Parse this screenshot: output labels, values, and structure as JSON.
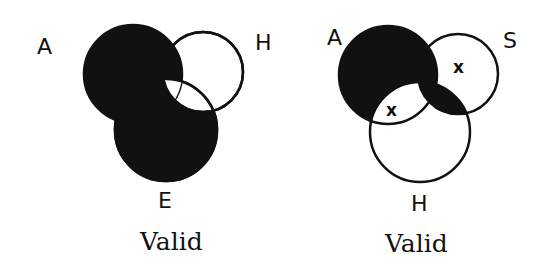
{
  "diagrams": [
    {
      "caption": "Valid",
      "circles": [
        {
          "label": "A",
          "cx": 133,
          "cy": 74,
          "r": 49
        },
        {
          "label": "H",
          "cx": 203,
          "cy": 72,
          "r": 40
        },
        {
          "label": "E",
          "cx": 166,
          "cy": 130,
          "r": 51
        }
      ],
      "labels": [
        {
          "text": "A",
          "x": 37,
          "y": 54
        },
        {
          "text": "H",
          "x": 255,
          "y": 50
        },
        {
          "text": "E",
          "x": 158,
          "y": 208
        }
      ],
      "marks": [
        {
          "text": "x",
          "x": 160,
          "y": 101
        }
      ],
      "shaded_regions": [
        "A only",
        "A∩E not H",
        "E only",
        "A∩H not E"
      ],
      "unshaded_regions": [
        "A∩H∩E (x)",
        "H only",
        "H∩E not A"
      ]
    },
    {
      "caption": "Valid",
      "circles": [
        {
          "label": "A",
          "cx": 388,
          "cy": 75,
          "r": 49
        },
        {
          "label": "S",
          "cx": 458,
          "cy": 74,
          "r": 40
        },
        {
          "label": "H",
          "cx": 420,
          "cy": 132,
          "r": 50
        }
      ],
      "labels": [
        {
          "text": "A",
          "x": 327,
          "y": 45
        },
        {
          "text": "S",
          "x": 503,
          "y": 48
        },
        {
          "text": "H",
          "x": 411,
          "y": 211
        }
      ],
      "marks": [
        {
          "text": "x",
          "x": 457,
          "y": 67
        },
        {
          "text": "x",
          "x": 390,
          "y": 110
        }
      ],
      "shaded_regions": [
        "A only",
        "A∩S not H",
        "A∩S∩H",
        "S∩H not A"
      ],
      "unshaded_regions": [
        "A∩H not S (x)",
        "S only (x)",
        "H only"
      ]
    }
  ],
  "colors": {
    "ink": "#111111",
    "paper": "#ffffff"
  }
}
